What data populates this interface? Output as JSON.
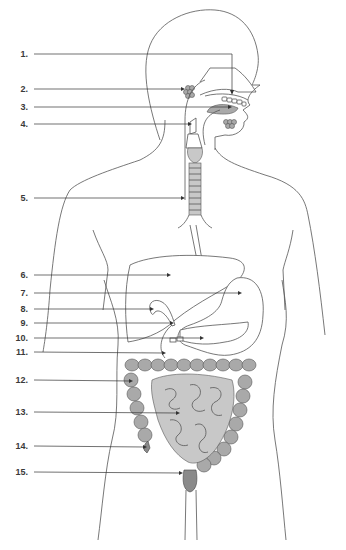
{
  "diagram": {
    "labels": [
      {
        "num": "1.",
        "y": 54
      },
      {
        "num": "2.",
        "y": 89
      },
      {
        "num": "3.",
        "y": 107
      },
      {
        "num": "4.",
        "y": 124
      },
      {
        "num": "5.",
        "y": 198
      },
      {
        "num": "6.",
        "y": 275
      },
      {
        "num": "7.",
        "y": 293
      },
      {
        "num": "8.",
        "y": 309
      },
      {
        "num": "9.",
        "y": 323
      },
      {
        "num": "10.",
        "y": 338
      },
      {
        "num": "11.",
        "y": 352
      },
      {
        "num": "12.",
        "y": 380
      },
      {
        "num": "13.",
        "y": 412
      },
      {
        "num": "14.",
        "y": 446
      },
      {
        "num": "15.",
        "y": 472
      }
    ],
    "colors": {
      "outline": "#555555",
      "leader": "#333333",
      "organ_gray": "#a9a9a9",
      "organ_light": "#c8c8c8",
      "label_text": "#3a3a3a"
    }
  }
}
